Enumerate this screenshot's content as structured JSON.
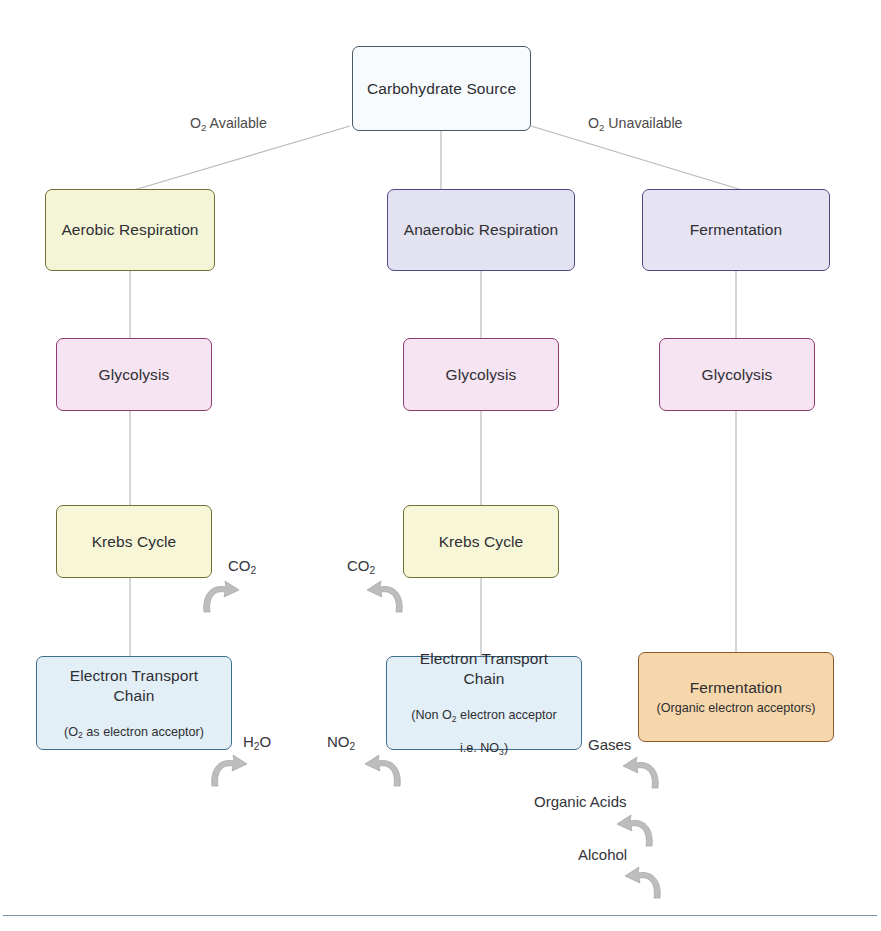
{
  "diagram": {
    "colors": {
      "carbohydrate_fill": "#f7fbfd",
      "carbohydrate_border": "#4a5a66",
      "aerobic_fill": "#f4f5d7",
      "aerobic_border": "#6e7034",
      "anaerobic_fill": "#e3e2f0",
      "anaerobic_border": "#4e4a83",
      "fermentation_fill": "#e6e4f2",
      "fermentation_border": "#4e4a83",
      "glycolysis_fill": "#f6e4f2",
      "glycolysis_border": "#8d3a6e",
      "krebs_fill": "#f7f7d8",
      "krebs_border": "#6e7034",
      "etc_fill": "#e3eff7",
      "etc_border": "#3f6e8c",
      "fermentation_product_fill": "#f6d7ab",
      "fermentation_product_border": "#8a5a28",
      "connector": "#b9b9bd",
      "arrow": "#b3b3b3",
      "footer_rule": "#7d93ac"
    },
    "nodes": {
      "carbohydrate_source": {
        "title": "Carbohydrate Source",
        "subtitle": ""
      },
      "aerobic_respiration": {
        "title": "Aerobic Respiration",
        "subtitle": ""
      },
      "anaerobic_respiration": {
        "title": "Anaerobic Respiration",
        "subtitle": ""
      },
      "fermentation_pathway": {
        "title": "Fermentation",
        "subtitle": ""
      },
      "glycolysis_aerobic": {
        "title": "Glycolysis",
        "subtitle": ""
      },
      "glycolysis_anaerobic": {
        "title": "Glycolysis",
        "subtitle": ""
      },
      "glycolysis_fermentation": {
        "title": "Glycolysis",
        "subtitle": ""
      },
      "krebs_aerobic": {
        "title": "Krebs Cycle",
        "subtitle": ""
      },
      "krebs_anaerobic": {
        "title": "Krebs Cycle",
        "subtitle": ""
      },
      "etc_aerobic": {
        "title": "Electron Transport\nChain",
        "subtitle_prefix": "(O",
        "subtitle_sub": "2",
        "subtitle_suffix": " as electron acceptor)"
      },
      "etc_anaerobic": {
        "title": "Electron Transport\nChain",
        "subtitle_line1_prefix": "(Non O",
        "subtitle_line1_sub": "2",
        "subtitle_line1_suffix": " electron acceptor",
        "subtitle_line2_prefix": "i.e. NO",
        "subtitle_line2_sub": "3",
        "subtitle_line2_suffix": ")"
      },
      "fermentation_products": {
        "title": "Fermentation",
        "subtitle": "(Organic electron acceptors)"
      }
    },
    "edge_labels": {
      "oxygen_available": {
        "prefix": "O",
        "sub": "2",
        "suffix": " Available"
      },
      "oxygen_unavailable": {
        "prefix": "O",
        "sub": "2",
        "suffix": " Unavailable"
      }
    },
    "products": {
      "co2_aerobic": {
        "prefix": "CO",
        "sub": "2",
        "suffix": ""
      },
      "co2_anaerobic": {
        "prefix": "CO",
        "sub": "2",
        "suffix": ""
      },
      "water": {
        "prefix": "H",
        "sub": "2",
        "suffix": "O"
      },
      "nitrite": {
        "prefix": "NO",
        "sub": "2",
        "suffix": ""
      },
      "gases": {
        "label": "Gases"
      },
      "organic_acids": {
        "label": "Organic Acids"
      },
      "alcohol": {
        "label": "Alcohol"
      }
    }
  }
}
